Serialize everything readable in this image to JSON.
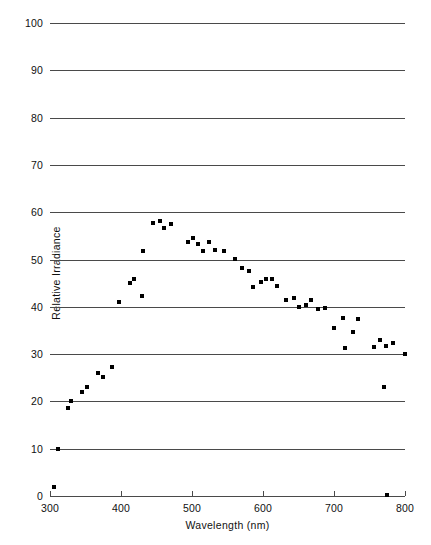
{
  "chart_data": {
    "type": "scatter",
    "title": "",
    "xlabel": "Wavelength (nm)",
    "ylabel": "Relative Irradiance",
    "xlim": [
      300,
      800
    ],
    "ylim": [
      0,
      100
    ],
    "xticks": [
      300,
      400,
      500,
      600,
      700,
      800
    ],
    "yticks": [
      0,
      10,
      20,
      30,
      40,
      50,
      60,
      70,
      80,
      90,
      100
    ],
    "grid": true,
    "grid_axis": "y",
    "legend": null,
    "marker": "square",
    "marker_color": "#000000",
    "series": [
      {
        "name": "Relative Irradiance",
        "points": [
          [
            305,
            2.0
          ],
          [
            311,
            10.0
          ],
          [
            325,
            18.5
          ],
          [
            330,
            20.0
          ],
          [
            345,
            22.0
          ],
          [
            352,
            23.1
          ],
          [
            368,
            25.9
          ],
          [
            375,
            25.1
          ],
          [
            388,
            27.3
          ],
          [
            397,
            41.1
          ],
          [
            412,
            45.0
          ],
          [
            418,
            45.9
          ],
          [
            429,
            42.2
          ],
          [
            431,
            51.8
          ],
          [
            445,
            57.7
          ],
          [
            455,
            58.1
          ],
          [
            461,
            56.6
          ],
          [
            471,
            57.6
          ],
          [
            494,
            53.8
          ],
          [
            501,
            54.6
          ],
          [
            509,
            53.3
          ],
          [
            516,
            51.9
          ],
          [
            524,
            53.7
          ],
          [
            533,
            52.1
          ],
          [
            545,
            51.9
          ],
          [
            561,
            50.1
          ],
          [
            571,
            48.2
          ],
          [
            580,
            47.5
          ],
          [
            586,
            44.2
          ],
          [
            597,
            45.2
          ],
          [
            604,
            45.8
          ],
          [
            612,
            45.9
          ],
          [
            620,
            44.3
          ],
          [
            632,
            41.5
          ],
          [
            643,
            41.9
          ],
          [
            650,
            39.9
          ],
          [
            661,
            40.3
          ],
          [
            668,
            41.5
          ],
          [
            678,
            39.5
          ],
          [
            688,
            39.8
          ],
          [
            700,
            35.6
          ],
          [
            713,
            37.6
          ],
          [
            716,
            31.2
          ],
          [
            727,
            34.7
          ],
          [
            734,
            37.4
          ],
          [
            756,
            31.6
          ],
          [
            765,
            33.0
          ],
          [
            770,
            23.1
          ],
          [
            773,
            31.8
          ],
          [
            775,
            0.3
          ],
          [
            783,
            32.3
          ],
          [
            800,
            30.0
          ]
        ]
      }
    ]
  },
  "axes": {
    "ytick_labels": [
      "100",
      "90",
      "80",
      "70",
      "60",
      "50",
      "40",
      "30",
      "20",
      "10",
      "0"
    ],
    "xtick_labels": [
      "300",
      "400",
      "500",
      "600",
      "700",
      "800"
    ]
  },
  "colors": {
    "marker": "#000000",
    "gridline": "#4a4a4a",
    "background": "#ffffff",
    "text": "#111111"
  }
}
